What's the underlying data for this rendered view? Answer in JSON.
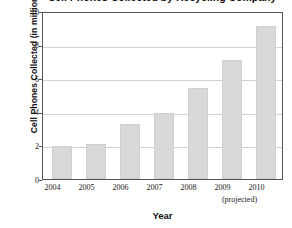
{
  "chart_data": {
    "type": "bar",
    "title": "Cell Phones Collected by Recycling Company",
    "xlabel": "Year",
    "ylabel": "Cell Phones Collected (in millions)",
    "categories": [
      "2004",
      "2005",
      "2006",
      "2007",
      "2008",
      "2009",
      "2010"
    ],
    "values": [
      2.0,
      2.1,
      3.3,
      4.0,
      5.5,
      7.15,
      9.2
    ],
    "ylim": [
      0,
      10
    ],
    "yticks": [
      "0",
      "2",
      "4",
      "6",
      "8",
      "10"
    ],
    "ytick_values": [
      0,
      2,
      4,
      6,
      8,
      10
    ],
    "grid": "horizontal",
    "legend": "none",
    "annotations": [
      {
        "text": "(projected)",
        "note": "spans beneath the 2009 and 2010 category labels"
      }
    ],
    "bar_color": "#d9d9d9",
    "frame_color": "#555555",
    "gridline_color": "#d2d2d2"
  }
}
